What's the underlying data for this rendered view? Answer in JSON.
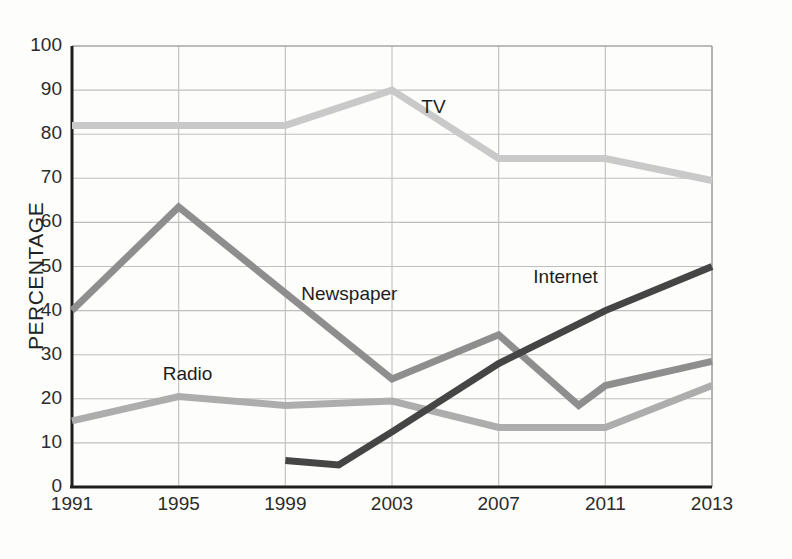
{
  "chart_data": {
    "type": "line",
    "title": "",
    "xlabel": "",
    "ylabel": "PERCENTAGE",
    "x": [
      1991,
      1995,
      1999,
      2001,
      2003,
      2007,
      2010,
      2011,
      2013
    ],
    "xtick_labels": [
      "1991",
      "1995",
      "1999",
      "2003",
      "2007",
      "2011",
      "2013"
    ],
    "xtick_values": [
      1991,
      1995,
      1999,
      2003,
      2007,
      2011,
      2013
    ],
    "ytick_labels": [
      "0",
      "10",
      "20",
      "30",
      "40",
      "50",
      "60",
      "70",
      "80",
      "90",
      "100"
    ],
    "ylim": [
      0,
      100
    ],
    "xlim": [
      1991,
      2013
    ],
    "grid": true,
    "legend_position": "inline-labels",
    "series": [
      {
        "name": "TV",
        "color": "#c9c9c9",
        "label_x": 2004.1,
        "label_y": 86,
        "points": [
          {
            "x": 1991,
            "y": 82
          },
          {
            "x": 1995,
            "y": 82
          },
          {
            "x": 1999,
            "y": 82
          },
          {
            "x": 2003,
            "y": 90
          },
          {
            "x": 2007,
            "y": 74.5
          },
          {
            "x": 2011,
            "y": 74.5
          },
          {
            "x": 2013,
            "y": 69.5
          }
        ]
      },
      {
        "name": "Newspaper",
        "color": "#8e8e8e",
        "label_x": 1999.6,
        "label_y": 43.5,
        "points": [
          {
            "x": 1991,
            "y": 40
          },
          {
            "x": 1995,
            "y": 63.5
          },
          {
            "x": 1999,
            "y": 44
          },
          {
            "x": 2003,
            "y": 24.5
          },
          {
            "x": 2007,
            "y": 34.5
          },
          {
            "x": 2010,
            "y": 18.5
          },
          {
            "x": 2011,
            "y": 23
          },
          {
            "x": 2013,
            "y": 28.5
          }
        ]
      },
      {
        "name": "Radio",
        "color": "#adadad",
        "label_x": 1994.4,
        "label_y": 25.5,
        "points": [
          {
            "x": 1991,
            "y": 15
          },
          {
            "x": 1995,
            "y": 20.5
          },
          {
            "x": 1999,
            "y": 18.5
          },
          {
            "x": 2003,
            "y": 19.5
          },
          {
            "x": 2007,
            "y": 13.5
          },
          {
            "x": 2011,
            "y": 13.5
          },
          {
            "x": 2013,
            "y": 23
          }
        ]
      },
      {
        "name": "Internet",
        "color": "#454545",
        "label_x": 2008.3,
        "label_y": 47.5,
        "points": [
          {
            "x": 1999,
            "y": 6
          },
          {
            "x": 2001,
            "y": 5
          },
          {
            "x": 2003,
            "y": 12.5
          },
          {
            "x": 2007,
            "y": 28
          },
          {
            "x": 2011,
            "y": 40
          },
          {
            "x": 2013,
            "y": 50
          }
        ]
      }
    ]
  },
  "axes": {
    "y_title": "PERCENTAGE"
  }
}
